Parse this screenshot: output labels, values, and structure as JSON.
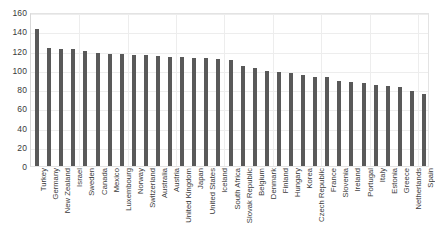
{
  "chart_data": {
    "type": "bar",
    "title": "",
    "xlabel": "",
    "ylabel": "",
    "ylim": [
      0,
      160
    ],
    "ytick_step": 20,
    "yticks": [
      0,
      20,
      40,
      60,
      80,
      100,
      120,
      140,
      160
    ],
    "grid": true,
    "legend": "none",
    "bar_color": "#595959",
    "gridline_color": "#ededed",
    "plot_border_color": "#e3e3e3",
    "tick_label_color": "#3a3a3a",
    "categories": [
      "Turkey",
      "Germany",
      "New Zealand",
      "Israel",
      "Sweden",
      "Canada",
      "Mexico",
      "Luxembourg",
      "Norway",
      "Switzerland",
      "Australia",
      "Austria",
      "United Kingdom",
      "Japan",
      "United States",
      "Iceland",
      "South Africa",
      "Slovak Republic",
      "Belgium",
      "Denmark",
      "Finland",
      "Hungary",
      "Korea",
      "Czech Republic",
      "France",
      "Slovenia",
      "Ireland",
      "Portugal",
      "Italy",
      "Estonia",
      "Greece",
      "Netherlands",
      "Spain"
    ],
    "values": [
      142,
      123,
      122,
      122,
      120,
      117,
      116,
      116,
      115,
      115,
      114,
      113,
      113,
      112,
      112,
      111,
      110,
      104,
      102,
      99,
      98,
      97,
      95,
      93,
      92,
      88,
      87,
      86,
      84,
      83,
      82,
      78,
      75
    ]
  }
}
